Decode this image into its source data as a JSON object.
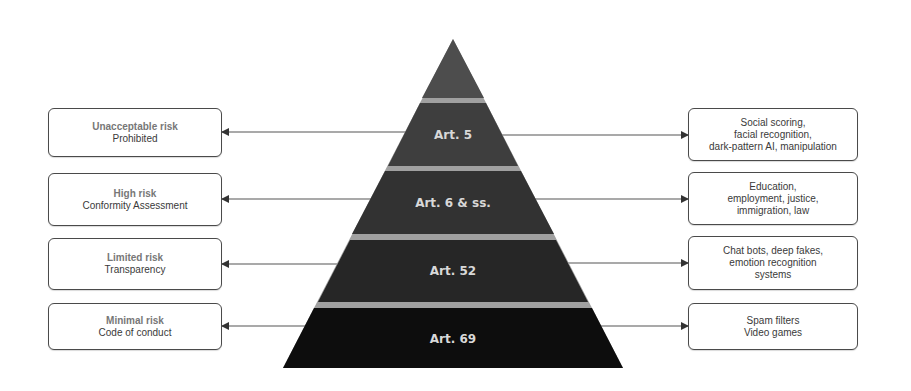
{
  "diagram": {
    "type": "risk-pyramid",
    "colors": {
      "tier_top": "#4d4d4d",
      "tier_art5": "#3e3e3e",
      "tier_art6": "#323232",
      "tier_art52": "#262626",
      "tier_art69": "#0d0d0d",
      "separator": "#9a9a9a",
      "arrow": "#555555",
      "box_border": "#4a4a4a"
    },
    "pyramid": {
      "tiers": [
        {
          "label": "Art. 5"
        },
        {
          "label": "Art. 6 & ss."
        },
        {
          "label": "Art. 52"
        },
        {
          "label": "Art. 69"
        }
      ]
    },
    "left_boxes": [
      {
        "title": "Unacceptable risk",
        "subtitle": "Prohibited"
      },
      {
        "title": "High risk",
        "subtitle": "Conformity Assessment"
      },
      {
        "title": "Limited risk",
        "subtitle": "Transparency"
      },
      {
        "title": "Minimal risk",
        "subtitle": "Code of conduct"
      }
    ],
    "right_boxes": [
      {
        "lines": [
          "Social scoring,",
          "facial recognition,",
          "dark-pattern AI, manipulation"
        ]
      },
      {
        "lines": [
          "Education,",
          "employment, justice,",
          "immigration, law"
        ]
      },
      {
        "lines": [
          "Chat bots, deep fakes,",
          "emotion recognition",
          "systems"
        ]
      },
      {
        "lines": [
          "Spam filters",
          "Video games"
        ]
      }
    ]
  }
}
